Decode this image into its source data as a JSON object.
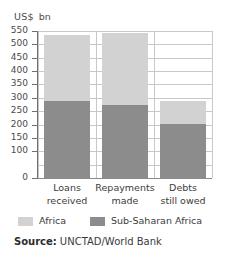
{
  "chart_data": {
    "type": "bar",
    "subtype": "stacked-bar",
    "title": "",
    "xlabel": "",
    "ylabel": "US$ bn",
    "unit_caption": {
      "currency": "US$",
      "unit": "bn"
    },
    "categories": [
      "Loans received",
      "Repayments made",
      "Debts still owed"
    ],
    "category_lines": [
      [
        "Loans",
        "received"
      ],
      [
        "Repayments",
        "made"
      ],
      [
        "Debts",
        "still owed"
      ]
    ],
    "series": [
      {
        "name": "Sub-Saharan Africa",
        "color": "#8c8c8c",
        "values": [
          288,
          272,
          203
        ]
      },
      {
        "name": "Africa",
        "color": "#d2d2d2",
        "values": [
          247,
          271,
          87
        ]
      }
    ],
    "totals": [
      535,
      543,
      290
    ],
    "ylim": [
      0,
      550
    ],
    "yticks": [
      0,
      100,
      150,
      200,
      250,
      300,
      350,
      400,
      450,
      500,
      550
    ],
    "ytick_labels": [
      "0",
      "100",
      "150",
      "200",
      "250",
      "300",
      "350",
      "400",
      "450",
      "500",
      "550"
    ],
    "gridlines": [
      50,
      100,
      150,
      200,
      250,
      300,
      350,
      400,
      450,
      500,
      550
    ],
    "grid": true,
    "legend_position": "bottom",
    "legend": [
      {
        "label": "Africa",
        "color": "#d2d2d2"
      },
      {
        "label": "Sub-Saharan Africa",
        "color": "#8c8c8c"
      }
    ]
  },
  "source": {
    "label": "Source:",
    "text": "UNCTAD/World Bank"
  }
}
